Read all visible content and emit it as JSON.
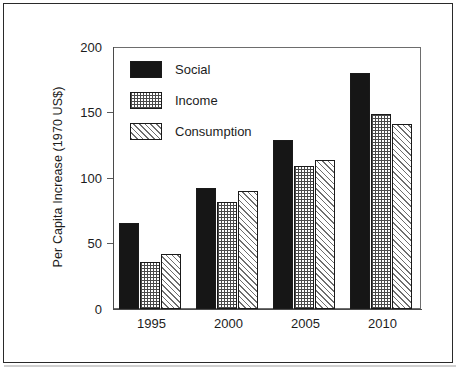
{
  "chart_data": {
    "type": "bar",
    "title": "",
    "xlabel": "",
    "ylabel": "Per Capita Increase (1970 US$)",
    "categories": [
      "1995",
      "2000",
      "2005",
      "2010"
    ],
    "series": [
      {
        "name": "Social",
        "values": [
          66,
          92,
          129,
          180
        ]
      },
      {
        "name": "Income",
        "values": [
          36,
          82,
          109,
          149
        ]
      },
      {
        "name": "Consumption",
        "values": [
          42,
          90,
          114,
          141
        ]
      }
    ],
    "ylim": [
      0,
      200
    ],
    "yticks": [
      0,
      50,
      100,
      150,
      200
    ],
    "ytick_labels": [
      "0",
      "50",
      "100",
      "150",
      "200"
    ],
    "grid": false,
    "legend_position": "top-left",
    "legend_entries": [
      "Social",
      "Income",
      "Consumption"
    ],
    "colors": {
      "social": "#161616",
      "income": "#4a4a4a",
      "consumption": "#6e6e6e",
      "axis": "#4a4a4a",
      "text": "#1c1c1c",
      "frame": "#2a2a2a"
    }
  }
}
